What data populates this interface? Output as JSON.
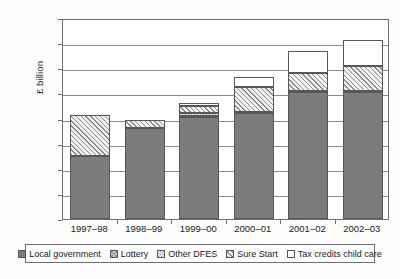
{
  "chart_data": {
    "type": "bar",
    "subtype": "stacked-bar",
    "title": "",
    "xlabel": "",
    "ylabel": "£ billion",
    "ylim": [
      0,
      4
    ],
    "ytick_step": 0.5,
    "yticks": [
      "4",
      "3.5",
      "3",
      "2.5",
      "2",
      "1.5",
      "1",
      "0.5",
      "0"
    ],
    "ytick_values": [
      4,
      3.5,
      3,
      2.5,
      2,
      1.5,
      1,
      0.5,
      0
    ],
    "grid": true,
    "grid_axis": "y",
    "legend_position": "bottom",
    "categories": [
      "1997–98",
      "1998–99",
      "1999–00",
      "2000–01",
      "2001–02",
      "2002–03"
    ],
    "series": [
      {
        "name": "Local government",
        "pattern": "solid-gray",
        "color": "#7c7c7c",
        "values": [
          1.25,
          1.82,
          2.03,
          2.1,
          2.52,
          2.52
        ]
      },
      {
        "name": "Lottery",
        "pattern": "fine-checker",
        "color": "#8f8f8f",
        "values": [
          0.0,
          0.0,
          0.03,
          0.02,
          0.02,
          0.03
        ]
      },
      {
        "name": "Other DFES",
        "pattern": "dotted-light",
        "color": "#ffffff",
        "values": [
          0.0,
          0.0,
          0.05,
          0.0,
          0.0,
          0.0
        ]
      },
      {
        "name": "Sure Start",
        "pattern": "diagonal-hatch",
        "color": "#f2f2f2",
        "values": [
          0.82,
          0.16,
          0.14,
          0.5,
          0.36,
          0.5
        ]
      },
      {
        "name": "Tax credits child care",
        "pattern": "white",
        "color": "#ffffff",
        "values": [
          0.0,
          0.0,
          0.06,
          0.2,
          0.45,
          0.51
        ]
      }
    ],
    "totals": [
      2.07,
      1.98,
      2.31,
      2.82,
      3.35,
      3.56
    ]
  },
  "legend": {
    "items": [
      {
        "label": "Local government"
      },
      {
        "label": "Lottery"
      },
      {
        "label": "Other DFES"
      },
      {
        "label": "Sure Start"
      },
      {
        "label": "Tax credits child care"
      }
    ]
  }
}
